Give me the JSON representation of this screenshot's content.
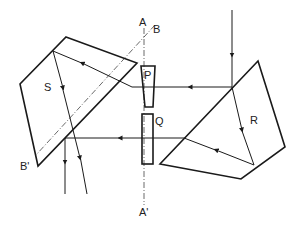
{
  "diagram": {
    "type": "optical-prism-system",
    "labels": {
      "prism_s": "S",
      "prism_r": "R",
      "wedge_p": "P",
      "plate_q": "Q",
      "axis_a_top": "A",
      "axis_a_bottom": "A'",
      "axis_b_top": "B",
      "axis_b_bottom": "B'"
    },
    "colors": {
      "line": "#1a1a1a",
      "axis": "#444444",
      "background": "#ffffff"
    }
  }
}
